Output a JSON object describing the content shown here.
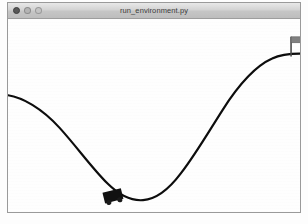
{
  "window": {
    "title": "run_environment.py",
    "controls": [
      {
        "name": "close",
        "label": "Close",
        "color": "#585858"
      },
      {
        "name": "minimize",
        "label": "Minimize",
        "color": "#b4b4b4"
      },
      {
        "name": "maximize",
        "label": "Maximize",
        "color": "#c4c4c4"
      }
    ]
  },
  "render": {
    "environment_name": "MountainCar",
    "background_color": "#fefefe",
    "terrain_color": "#0d0d0d",
    "terrain_width": 2.2,
    "car_color": "#111111",
    "wheel_color": "#1a1a1a",
    "flag_pole_color": "#4a4a4a",
    "flag_color": "#808080",
    "terrain_path": "M 0 77 C 14 79 34 90 52 110 C 70 130 84 150 100 166 C 112 178 124 184 136 183 C 150 182 162 172 174 156 C 188 138 202 114 216 92 C 230 70 248 48 266 40 C 274 36 282 35 294 35",
    "car": {
      "x": 107,
      "y": 184,
      "width": 19,
      "height": 11,
      "rotation": -14,
      "wheel_radius": 2.6
    },
    "flag": {
      "pole_x": 285,
      "pole_top_y": 18,
      "pole_bottom_y": 38,
      "banner_width": 10,
      "banner_height": 6
    }
  }
}
